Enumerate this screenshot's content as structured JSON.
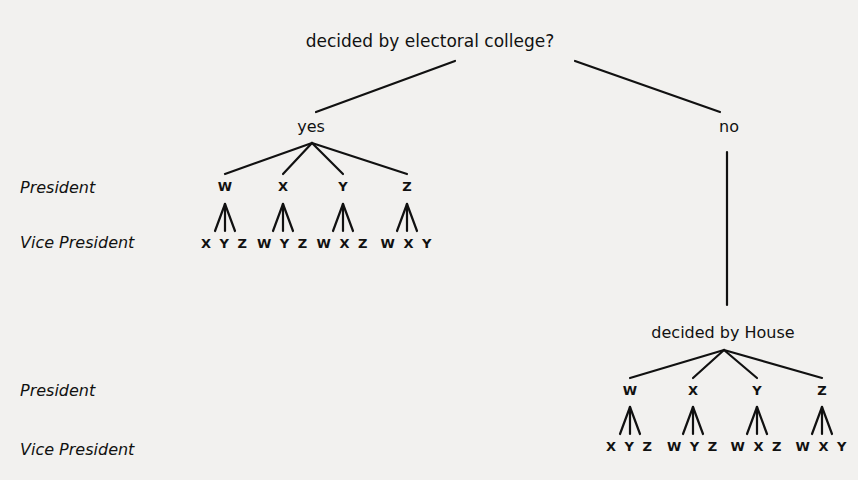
{
  "diagram": {
    "root": {
      "label": "decided by electoral college?",
      "x": 430,
      "y": 47
    },
    "branches": {
      "yes": {
        "label": "yes",
        "x": 311,
        "y": 132
      },
      "no": {
        "label": "no",
        "x": 729,
        "y": 132
      }
    },
    "house_node": {
      "label": "decided by House",
      "x": 723,
      "y": 338
    },
    "row_labels": [
      {
        "text": "President",
        "x": 20,
        "y": 193
      },
      {
        "text": "Vice President",
        "x": 20,
        "y": 248
      },
      {
        "text": "President",
        "x": 20,
        "y": 396
      },
      {
        "text": "Vice President",
        "x": 20,
        "y": 455
      }
    ],
    "trees": [
      {
        "name": "electoral-college",
        "apex": [
          312,
          143
        ],
        "president_y": 191,
        "vp_apex_y": 204,
        "vp_base_y": 231,
        "vp_y": 248,
        "presidents": [
          {
            "candidate": "W",
            "x": 225,
            "vice_presidents": "XYZ"
          },
          {
            "candidate": "X",
            "x": 283,
            "vice_presidents": "WYZ"
          },
          {
            "candidate": "Y",
            "x": 343,
            "vice_presidents": "WXZ"
          },
          {
            "candidate": "Z",
            "x": 407,
            "vice_presidents": "WXY"
          }
        ]
      },
      {
        "name": "house",
        "apex": [
          724,
          350
        ],
        "president_y": 395,
        "vp_apex_y": 407,
        "vp_base_y": 434,
        "vp_y": 451,
        "presidents": [
          {
            "candidate": "W",
            "x": 630,
            "vice_presidents": "XYZ"
          },
          {
            "candidate": "X",
            "x": 693,
            "vice_presidents": "WYZ"
          },
          {
            "candidate": "Y",
            "x": 757,
            "vice_presidents": "WXZ"
          },
          {
            "candidate": "Z",
            "x": 822,
            "vice_presidents": "WXY"
          }
        ]
      }
    ],
    "edges_top": [
      [
        455,
        61,
        316,
        112
      ],
      [
        575,
        61,
        720,
        112
      ],
      [
        727,
        152,
        727,
        305
      ]
    ]
  }
}
